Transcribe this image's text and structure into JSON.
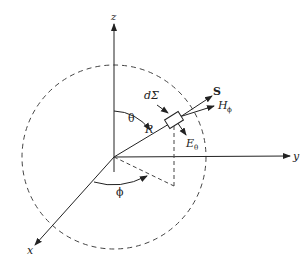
{
  "diagram": {
    "labels": {
      "z_axis": "z",
      "y_axis": "y",
      "x_axis": "x",
      "theta": "θ",
      "phi": "ϕ",
      "radius": "R",
      "surface_element": "dΣ",
      "poynting": "S",
      "h_field": "H",
      "h_sub": "ϕ",
      "e_field": "E",
      "e_sub": "θ"
    },
    "colors": {
      "line": "#222222",
      "dash": "#444444",
      "background": "#ffffff"
    }
  }
}
